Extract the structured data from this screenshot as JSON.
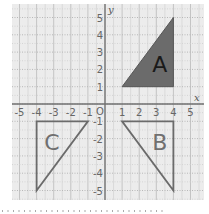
{
  "diagram": {
    "type": "coordinate-grid",
    "axes": {
      "x_label": "x",
      "y_label": "y",
      "origin_label": "O",
      "x_range": [
        -5,
        5
      ],
      "y_range": [
        -5,
        5
      ],
      "x_ticks": [
        "-5",
        "-4",
        "-3",
        "-2",
        "-1",
        "1",
        "2",
        "3",
        "4",
        "5"
      ],
      "y_ticks": [
        "5",
        "4",
        "3",
        "2",
        "1",
        "-1",
        "-2",
        "-3",
        "-4",
        "-5"
      ]
    },
    "shapes": [
      {
        "label": "A",
        "vertices": [
          [
            1,
            1
          ],
          [
            4,
            5
          ],
          [
            4,
            1
          ]
        ],
        "style": "filled",
        "fill": "#6b6b6b",
        "stroke": "#555555"
      },
      {
        "label": "B",
        "vertices": [
          [
            1,
            -1
          ],
          [
            4,
            -1
          ],
          [
            4,
            -5
          ]
        ],
        "style": "outline",
        "stroke": "#6b6b6b"
      },
      {
        "label": "C",
        "vertices": [
          [
            -4,
            -1
          ],
          [
            -1,
            -1
          ],
          [
            -4,
            -5
          ]
        ],
        "style": "outline",
        "stroke": "#6b6b6b"
      }
    ],
    "colors": {
      "background": "#ececec",
      "grid": "#c8c8c8",
      "axis": "#707070"
    }
  }
}
